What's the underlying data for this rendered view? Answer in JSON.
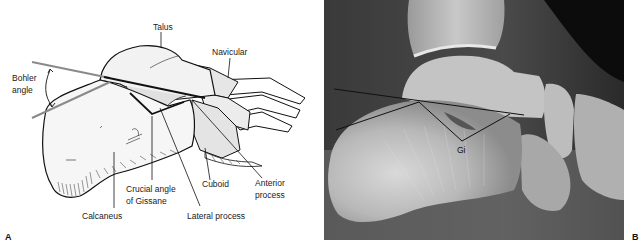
{
  "figure": {
    "panels": [
      {
        "id": "A",
        "type": "line-drawing",
        "letter": "A",
        "labels": {
          "talus": "Talus",
          "navicular": "Navicular",
          "bohler_line1": "Bohler",
          "bohler_line2": "angle",
          "crucial_line1": "Crucial angle",
          "crucial_line2": "of Gissane",
          "calcaneus": "Calcaneus",
          "cuboid": "Cuboid",
          "anterior_line1": "Anterior",
          "anterior_line2": "process",
          "lateral_process": "Lateral process"
        }
      },
      {
        "id": "B",
        "type": "radiograph",
        "letter": "B",
        "labels": {
          "gissane": "Gi"
        }
      }
    ],
    "colors": {
      "line_dark": "#111111",
      "line_gray": "#8a8a8a",
      "bone_fill": "#f4f4f4",
      "xray_dark": "#2a2a2a",
      "xray_bone": "#d8d8d8"
    }
  }
}
